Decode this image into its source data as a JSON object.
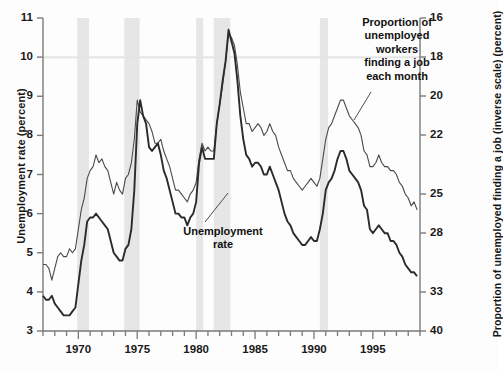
{
  "chart_data": {
    "type": "line",
    "title": "",
    "subtitle": "",
    "xlabel": "",
    "ylabel": "Unemployment rate (percent)",
    "y2label": "Proportion of unemployed finding a job (inverse scale) (percent)",
    "grid": false,
    "legend_position": "inline-annotations",
    "xlim": [
      1967.0,
      1999.0
    ],
    "xticks_labeled": [
      1970,
      1975,
      1980,
      1985,
      1990,
      1995
    ],
    "xticks_minor_step": 1,
    "ylim_left": [
      3,
      11
    ],
    "yticks_left": [
      3,
      4,
      5,
      6,
      7,
      8,
      9,
      10,
      11
    ],
    "ylim_right_inverse": [
      16,
      40
    ],
    "yticks_right": [
      16,
      18,
      20,
      22,
      25,
      28,
      33,
      40
    ],
    "right_axis_note": "inverse, nonlinear spacing",
    "colors": {
      "unemployment_rate_line": "#2b2b2b",
      "job_finding_line": "#4a4a4a",
      "recession_band": "#e6e6e6",
      "axis": "#7a7a7a",
      "text": "#111111"
    },
    "annotations": [
      {
        "name": "job-finding-label",
        "text": "Proportion of unemployed workers finding a job each month",
        "lines": [
          "Proportion of",
          "unemployed",
          "workers",
          "finding a job",
          "each month"
        ]
      },
      {
        "name": "unemployment-rate-label",
        "text": "Unemployment rate",
        "lines": [
          "Unemployment",
          "rate"
        ]
      }
    ],
    "recession_bands": [
      {
        "start": 1969.9,
        "end": 1970.9
      },
      {
        "start": 1973.9,
        "end": 1975.2
      },
      {
        "start": 1980.0,
        "end": 1980.6
      },
      {
        "start": 1981.5,
        "end": 1982.9
      },
      {
        "start": 1990.5,
        "end": 1991.2
      }
    ],
    "series": [
      {
        "name": "Unemployment rate",
        "axis": "left",
        "units": "percent",
        "x": [
          1967.0,
          1967.25,
          1967.5,
          1967.75,
          1968.0,
          1968.25,
          1968.5,
          1968.75,
          1969.0,
          1969.25,
          1969.5,
          1969.75,
          1970.0,
          1970.25,
          1970.5,
          1970.75,
          1971.0,
          1971.25,
          1971.5,
          1971.75,
          1972.0,
          1972.25,
          1972.5,
          1972.75,
          1973.0,
          1973.25,
          1973.5,
          1973.75,
          1974.0,
          1974.25,
          1974.5,
          1974.75,
          1975.0,
          1975.25,
          1975.5,
          1975.75,
          1976.0,
          1976.25,
          1976.5,
          1976.75,
          1977.0,
          1977.25,
          1977.5,
          1977.75,
          1978.0,
          1978.25,
          1978.5,
          1978.75,
          1979.0,
          1979.25,
          1979.5,
          1979.75,
          1980.0,
          1980.25,
          1980.5,
          1980.75,
          1981.0,
          1981.25,
          1981.5,
          1981.75,
          1982.0,
          1982.25,
          1982.5,
          1982.75,
          1983.0,
          1983.25,
          1983.5,
          1983.75,
          1984.0,
          1984.25,
          1984.5,
          1984.75,
          1985.0,
          1985.25,
          1985.5,
          1985.75,
          1986.0,
          1986.25,
          1986.5,
          1986.75,
          1987.0,
          1987.25,
          1987.5,
          1987.75,
          1988.0,
          1988.25,
          1988.5,
          1988.75,
          1989.0,
          1989.25,
          1989.5,
          1989.75,
          1990.0,
          1990.25,
          1990.5,
          1990.75,
          1991.0,
          1991.25,
          1991.5,
          1991.75,
          1992.0,
          1992.25,
          1992.5,
          1992.75,
          1993.0,
          1993.25,
          1993.5,
          1993.75,
          1994.0,
          1994.25,
          1994.5,
          1994.75,
          1995.0,
          1995.25,
          1995.5,
          1995.75,
          1996.0,
          1996.25,
          1996.5,
          1996.75,
          1997.0,
          1997.25,
          1997.5,
          1997.75,
          1998.0,
          1998.25,
          1998.5,
          1998.75
        ],
        "y": [
          3.9,
          3.8,
          3.8,
          3.9,
          3.7,
          3.6,
          3.5,
          3.4,
          3.4,
          3.4,
          3.5,
          3.6,
          4.2,
          4.8,
          5.2,
          5.8,
          5.9,
          5.9,
          6.0,
          5.9,
          5.8,
          5.7,
          5.6,
          5.3,
          5.0,
          4.9,
          4.8,
          4.8,
          5.1,
          5.2,
          5.6,
          6.6,
          8.3,
          8.9,
          8.5,
          8.3,
          7.7,
          7.6,
          7.7,
          7.8,
          7.5,
          7.1,
          6.9,
          6.6,
          6.3,
          6.0,
          6.0,
          5.9,
          5.9,
          5.7,
          5.9,
          6.0,
          6.3,
          7.3,
          7.7,
          7.4,
          7.4,
          7.4,
          7.4,
          8.3,
          8.8,
          9.4,
          9.9,
          10.7,
          10.4,
          10.1,
          9.4,
          8.5,
          7.9,
          7.5,
          7.4,
          7.2,
          7.3,
          7.3,
          7.2,
          7.0,
          7.0,
          7.2,
          7.0,
          6.8,
          6.6,
          6.3,
          6.0,
          5.8,
          5.7,
          5.5,
          5.4,
          5.3,
          5.2,
          5.2,
          5.3,
          5.4,
          5.3,
          5.3,
          5.6,
          6.0,
          6.6,
          6.8,
          6.9,
          7.1,
          7.4,
          7.6,
          7.6,
          7.4,
          7.1,
          7.0,
          6.9,
          6.8,
          6.6,
          6.2,
          6.1,
          5.6,
          5.5,
          5.6,
          5.7,
          5.6,
          5.5,
          5.5,
          5.3,
          5.3,
          5.2,
          5.0,
          4.9,
          4.7,
          4.6,
          4.5,
          4.5,
          4.4
        ]
      },
      {
        "name": "Proportion of unemployed finding a job each month",
        "axis": "right",
        "units": "percent (inverse scale)",
        "x": [
          1967.0,
          1967.25,
          1967.5,
          1967.75,
          1968.0,
          1968.25,
          1968.5,
          1968.75,
          1969.0,
          1969.25,
          1969.5,
          1969.75,
          1970.0,
          1970.25,
          1970.5,
          1970.75,
          1971.0,
          1971.25,
          1971.5,
          1971.75,
          1972.0,
          1972.25,
          1972.5,
          1972.75,
          1973.0,
          1973.25,
          1973.5,
          1973.75,
          1974.0,
          1974.25,
          1974.5,
          1974.75,
          1975.0,
          1975.25,
          1975.5,
          1975.75,
          1976.0,
          1976.25,
          1976.5,
          1976.75,
          1977.0,
          1977.25,
          1977.5,
          1977.75,
          1978.0,
          1978.25,
          1978.5,
          1978.75,
          1979.0,
          1979.25,
          1979.5,
          1979.75,
          1980.0,
          1980.25,
          1980.5,
          1980.75,
          1981.0,
          1981.25,
          1981.5,
          1981.75,
          1982.0,
          1982.25,
          1982.5,
          1982.75,
          1983.0,
          1983.25,
          1983.5,
          1983.75,
          1984.0,
          1984.25,
          1984.5,
          1984.75,
          1985.0,
          1985.25,
          1985.5,
          1985.75,
          1986.0,
          1986.25,
          1986.5,
          1986.75,
          1987.0,
          1987.25,
          1987.5,
          1987.75,
          1988.0,
          1988.25,
          1988.5,
          1988.75,
          1989.0,
          1989.25,
          1989.5,
          1989.75,
          1990.0,
          1990.25,
          1990.5,
          1990.75,
          1991.0,
          1991.25,
          1991.5,
          1991.75,
          1992.0,
          1992.25,
          1992.5,
          1992.75,
          1993.0,
          1993.25,
          1993.5,
          1993.75,
          1994.0,
          1994.25,
          1994.5,
          1994.75,
          1995.0,
          1995.25,
          1995.5,
          1995.75,
          1996.0,
          1996.25,
          1996.5,
          1996.75,
          1997.0,
          1997.25,
          1997.5,
          1997.75,
          1998.0,
          1998.25,
          1998.5,
          1998.75
        ],
        "y_left_equivalent": [
          4.7,
          4.7,
          4.6,
          4.3,
          4.6,
          4.9,
          5.0,
          4.9,
          4.9,
          5.1,
          5.0,
          5.1,
          5.6,
          6.1,
          6.4,
          6.9,
          7.1,
          7.2,
          7.5,
          7.3,
          7.4,
          7.2,
          7.1,
          6.8,
          6.5,
          6.8,
          6.6,
          6.5,
          6.9,
          7.0,
          7.3,
          7.9,
          8.9,
          8.6,
          8.5,
          8.4,
          8.3,
          8.1,
          7.8,
          7.8,
          7.9,
          7.6,
          7.4,
          7.2,
          6.9,
          6.6,
          6.6,
          6.5,
          6.4,
          6.3,
          6.5,
          6.6,
          6.8,
          7.4,
          7.8,
          7.6,
          7.7,
          7.6,
          7.6,
          8.3,
          8.8,
          9.3,
          9.9,
          10.6,
          10.5,
          10.3,
          9.8,
          9.1,
          8.7,
          8.3,
          8.3,
          8.1,
          8.2,
          8.3,
          8.2,
          8.0,
          8.1,
          8.3,
          8.1,
          8.0,
          7.7,
          7.5,
          7.3,
          7.1,
          7.1,
          6.9,
          6.8,
          6.7,
          6.6,
          6.7,
          6.8,
          6.9,
          6.8,
          6.7,
          6.9,
          7.4,
          7.9,
          8.2,
          8.3,
          8.5,
          8.7,
          8.9,
          8.9,
          8.7,
          8.5,
          8.4,
          8.3,
          8.2,
          8.0,
          7.6,
          7.5,
          7.2,
          7.2,
          7.3,
          7.5,
          7.3,
          7.2,
          7.2,
          7.1,
          7.1,
          7.0,
          6.8,
          6.7,
          6.5,
          6.4,
          6.2,
          6.3,
          6.1
        ]
      }
    ]
  },
  "axes": {
    "left_title": "Unemployment rate (percent)",
    "right_title": "Proportion of unemployed finding a job (inverse scale) (percent)",
    "left_ticks": [
      "11",
      "10",
      "9",
      "8",
      "7",
      "6",
      "5",
      "4",
      "3"
    ],
    "right_ticks": [
      "16",
      "18",
      "20",
      "22",
      "25",
      "28",
      "33",
      "40"
    ],
    "x_ticks": [
      "1970",
      "1975",
      "1980",
      "1985",
      "1990",
      "1995"
    ]
  },
  "annotations": {
    "job_line1": "Proportion of",
    "job_line2": "unemployed",
    "job_line3": "workers",
    "job_line4": "finding a job",
    "job_line5": "each month",
    "unrate_line1": "Unemployment",
    "unrate_line2": "rate"
  }
}
